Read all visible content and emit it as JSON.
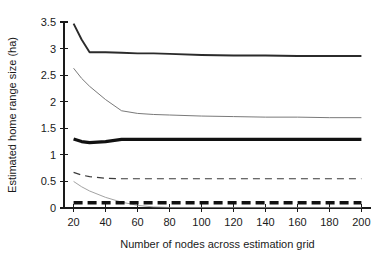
{
  "chart_data": {
    "type": "line",
    "title": "",
    "xlabel": "Number of nodes across estimation grid",
    "ylabel": "Estimated home range size (ha)",
    "xlim": [
      14,
      206
    ],
    "ylim": [
      0,
      3.5
    ],
    "grid": false,
    "legend": "none",
    "xticks": [
      20,
      40,
      60,
      80,
      100,
      120,
      140,
      160,
      180,
      200
    ],
    "xtick_labels": [
      "20",
      "40",
      "60",
      "80",
      "100",
      "120",
      "140",
      "160",
      "180",
      "200"
    ],
    "yticks": [
      0,
      0.5,
      1,
      1.5,
      2,
      2.5,
      3,
      3.5
    ],
    "ytick_labels": [
      "0",
      "0.5",
      "1",
      "1.5",
      "2",
      "2.5",
      "3",
      "3.5"
    ],
    "x": [
      20,
      25,
      30,
      40,
      50,
      60,
      70,
      80,
      100,
      120,
      140,
      160,
      180,
      200
    ],
    "series": [
      {
        "name": "upper-thick-solid",
        "style": "solid",
        "width": 1.9,
        "color": "#2b2b2b",
        "values": [
          3.47,
          3.17,
          2.93,
          2.93,
          2.92,
          2.91,
          2.91,
          2.9,
          2.88,
          2.87,
          2.87,
          2.86,
          2.86,
          2.86
        ]
      },
      {
        "name": "second-thin-solid",
        "style": "solid",
        "width": 0.9,
        "color": "#6a6a6a",
        "values": [
          2.63,
          2.44,
          2.29,
          2.04,
          1.83,
          1.78,
          1.76,
          1.75,
          1.73,
          1.72,
          1.71,
          1.71,
          1.7,
          1.7
        ]
      },
      {
        "name": "middle-heavy-solid",
        "style": "solid",
        "width": 3.2,
        "color": "#111111",
        "values": [
          1.3,
          1.25,
          1.23,
          1.25,
          1.29,
          1.29,
          1.29,
          1.29,
          1.29,
          1.29,
          1.29,
          1.29,
          1.29,
          1.29
        ]
      },
      {
        "name": "thin-dashed",
        "style": "dashed",
        "width": 1.2,
        "color": "#3a3a3a",
        "dash": "7,5",
        "values": [
          0.67,
          0.62,
          0.59,
          0.56,
          0.55,
          0.55,
          0.55,
          0.55,
          0.55,
          0.55,
          0.55,
          0.55,
          0.55,
          0.55
        ]
      },
      {
        "name": "declining-thin-gray",
        "style": "solid",
        "width": 0.8,
        "color": "#8a8a8a",
        "values": [
          0.5,
          0.4,
          0.32,
          0.2,
          0.11,
          0.05,
          0.02,
          0.01,
          0.01,
          0.01,
          0.01,
          0.01,
          0.01,
          0.01
        ]
      },
      {
        "name": "bottom-heavy-dashed",
        "style": "dashed",
        "width": 3.4,
        "color": "#111111",
        "dash": "9,5",
        "values": [
          0.1,
          0.1,
          0.1,
          0.1,
          0.1,
          0.1,
          0.1,
          0.1,
          0.1,
          0.1,
          0.1,
          0.1,
          0.1,
          0.1
        ]
      }
    ]
  }
}
